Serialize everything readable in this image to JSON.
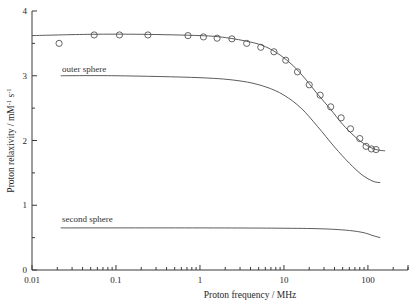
{
  "chart_data": {
    "type": "line",
    "title": "",
    "xlabel": "Proton frequency / MHz",
    "ylabel_text": "Proton relaxivity / mM",
    "ylabel_sup1": "-1",
    "ylabel_mid": " s",
    "ylabel_sup2": "-1",
    "ylabel_full": "Proton relaxivity / mM-1 s-1",
    "xscale": "log",
    "yscale": "linear",
    "xlim": [
      0.01,
      300
    ],
    "ylim": [
      0,
      4
    ],
    "grid": false,
    "legend_position": "inline-annotations",
    "xticklabels": [
      "0.01",
      "0.1",
      "1",
      "10",
      "100"
    ],
    "xtickvalues": [
      0.01,
      0.1,
      1,
      10,
      100
    ],
    "yticklabels": [
      "0",
      "1",
      "2",
      "3",
      "4"
    ],
    "ytickvalues": [
      0,
      1,
      2,
      3,
      4
    ],
    "series": [
      {
        "name": "total relaxivity (measured)",
        "style": "open-circle-markers",
        "x": [
          0.021,
          0.055,
          0.11,
          0.24,
          0.72,
          1.1,
          1.6,
          2.4,
          3.6,
          5.3,
          7.6,
          10.5,
          14.5,
          20,
          27,
          36,
          48,
          62,
          80,
          95,
          110,
          125
        ],
        "y": [
          3.5,
          3.63,
          3.63,
          3.63,
          3.62,
          3.6,
          3.58,
          3.57,
          3.5,
          3.44,
          3.37,
          3.24,
          3.06,
          2.86,
          2.7,
          2.52,
          2.35,
          2.18,
          2.03,
          1.91,
          1.87,
          1.86
        ]
      },
      {
        "name": "fit curve (total)",
        "style": "solid-line",
        "x": [
          0.01,
          0.05,
          0.2,
          1,
          2,
          4,
          6,
          9,
          13,
          18,
          25,
          35,
          50,
          70,
          95,
          125,
          160
        ],
        "y": [
          3.62,
          3.64,
          3.64,
          3.62,
          3.59,
          3.52,
          3.45,
          3.32,
          3.15,
          2.95,
          2.72,
          2.5,
          2.25,
          2.06,
          1.93,
          1.86,
          1.84
        ]
      },
      {
        "name": "outer sphere",
        "style": "solid-line",
        "x": [
          0.022,
          0.1,
          1,
          3,
          6,
          10,
          16,
          25,
          40,
          60,
          85,
          115,
          140
        ],
        "y": [
          3.0,
          3.0,
          2.97,
          2.92,
          2.83,
          2.7,
          2.5,
          2.22,
          1.9,
          1.65,
          1.47,
          1.37,
          1.35
        ]
      },
      {
        "name": "second sphere",
        "style": "solid-line",
        "x": [
          0.022,
          1,
          10,
          30,
          60,
          90,
          115,
          140
        ],
        "y": [
          0.65,
          0.65,
          0.645,
          0.635,
          0.61,
          0.575,
          0.53,
          0.5
        ]
      }
    ],
    "annotations": [
      {
        "id": "outer-sphere-label",
        "text": "outer sphere",
        "x_px": 62,
        "y_px": 72
      },
      {
        "id": "second-sphere-label",
        "text": "second sphere",
        "x_px": 62,
        "y_px": 222
      }
    ],
    "colors": {
      "axis": "#3a3a3a",
      "curve": "#4a4a4a",
      "marker": "#555555",
      "text": "#262626",
      "background": "#ffffff"
    }
  }
}
